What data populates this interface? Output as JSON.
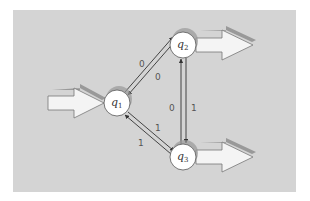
{
  "diagram": {
    "type": "finite-automaton",
    "colors": {
      "panel": "#d4d4d4",
      "node_fill": "#ffffff",
      "node_stroke": "#555555",
      "node_shadow": "#999999",
      "arrow_fill": "#f4f4f4",
      "arrow_stroke": "#777777",
      "arrow_shadow": "#8a8a8a",
      "edge": "#333333"
    },
    "states": [
      {
        "id": "q1",
        "name": "q",
        "sub": "1",
        "x": 117,
        "y": 103,
        "initial": true,
        "accepting": false
      },
      {
        "id": "q2",
        "name": "q",
        "sub": "2",
        "x": 183,
        "y": 45,
        "initial": false,
        "accepting": true
      },
      {
        "id": "q3",
        "name": "q",
        "sub": "3",
        "x": 183,
        "y": 157,
        "initial": false,
        "accepting": true
      }
    ],
    "transitions": [
      {
        "from": "q1",
        "to": "q2",
        "label": "0"
      },
      {
        "from": "q2",
        "to": "q1",
        "label": "0"
      },
      {
        "from": "q3",
        "to": "q2",
        "label": "0"
      },
      {
        "from": "q2",
        "to": "q3",
        "label": "1"
      },
      {
        "from": "q1",
        "to": "q3",
        "label": "1"
      },
      {
        "from": "q3",
        "to": "q1",
        "label": "1"
      }
    ],
    "labels": {
      "q1_q2_upper": "0",
      "q1_q2_lower": "0",
      "q2_q3_left": "0",
      "q2_q3_right": "1",
      "q1_q3_upper": "1",
      "q1_q3_lower": "1",
      "q1_name": "q",
      "q1_sub": "1",
      "q2_name": "q",
      "q2_sub": "2",
      "q3_name": "q",
      "q3_sub": "3"
    }
  }
}
